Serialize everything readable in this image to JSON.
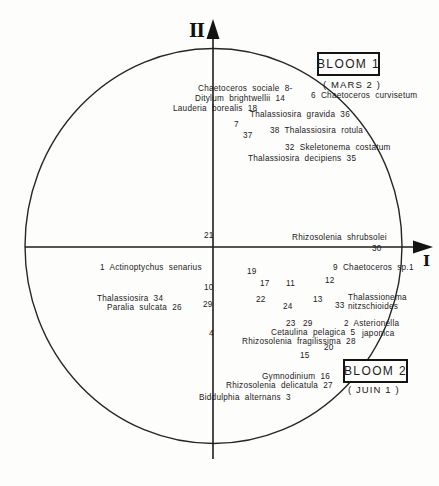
{
  "figure": {
    "axis_x_label": "I",
    "axis_y_label": "II",
    "bloom1": {
      "title": "BLOOM 1",
      "subtitle": "( MARS 2 )"
    },
    "bloom2": {
      "title": "BLOOM 2",
      "subtitle": "( JUIN 1 )"
    }
  },
  "chart_data": {
    "type": "scatter",
    "title": "",
    "axis_labels": {
      "x": "I",
      "y": "II"
    },
    "layout": "correspondence-analysis ordination: two orthogonal axes (I horizontal, II vertical) inside a unit circle; species plotted by number",
    "clusters": [
      {
        "name": "BLOOM 1",
        "season": "( MARS 2 )",
        "position": "upper right"
      },
      {
        "name": "BLOOM 2",
        "season": "( JUIN 1 )",
        "position": "lower right"
      }
    ],
    "species_by_number": {
      "1": "Actinoptychus senarius",
      "2": "Asterionella japonica",
      "3": "Biddulphia alternans",
      "5": "Cetaulina pelagica",
      "6": "Chaetoceros curvisetum",
      "8": "Chaetoceros sociale",
      "9": "Chaetoceros sp.1",
      "14": "Ditylum brightwellii",
      "16": "Gymnodinium",
      "18": "Lauderia borealis",
      "26": "Paralia sulcata",
      "27": "Rhizosolenia delicatula",
      "28": "Rhizosolenia fragilissima",
      "30": "Rhizosolenia shrubsolei",
      "32": "Skeletonema costatum",
      "33": "Thalassionema nitzschioides",
      "34": "Thalassiosira",
      "35": "Thalassiosira decipiens",
      "36": "Thalassiosira gravida",
      "38": "Thalassiosira rotula"
    },
    "numbered_points_without_species_label": [
      4,
      7,
      10,
      11,
      12,
      13,
      15,
      17,
      19,
      20,
      21,
      22,
      23,
      24,
      29,
      37
    ],
    "labels": [
      {
        "text": "Chaetoceros sociale 8-",
        "x": 198,
        "y": 84
      },
      {
        "text": "Ditylum brightwellii 14",
        "x": 195,
        "y": 94
      },
      {
        "text": "Lauderia borealis 18",
        "x": 173,
        "y": 104
      },
      {
        "text": "6 Chaetoceros curvisetum",
        "x": 311,
        "y": 91
      },
      {
        "text": "Thalassiosira gravida 36",
        "x": 250,
        "y": 110
      },
      {
        "text": "7",
        "x": 234,
        "y": 120
      },
      {
        "text": "37",
        "x": 243,
        "y": 131
      },
      {
        "text": "38 Thalassiosira rotula",
        "x": 270,
        "y": 126
      },
      {
        "text": "32 Skeletonema costatum",
        "x": 285,
        "y": 143
      },
      {
        "text": "Thalassiosira decipiens 35",
        "x": 248,
        "y": 154
      },
      {
        "text": "21",
        "x": 204,
        "y": 231
      },
      {
        "text": "Rhizosolenia shrubsolei",
        "x": 292,
        "y": 233
      },
      {
        "text": "30",
        "x": 372,
        "y": 244
      },
      {
        "text": "1 Actinoptychus senarius",
        "x": 100,
        "y": 263
      },
      {
        "text": "9 Chaetoceros sp.1",
        "x": 333,
        "y": 263
      },
      {
        "text": "19",
        "x": 247,
        "y": 267
      },
      {
        "text": "17",
        "x": 260,
        "y": 279
      },
      {
        "text": "11",
        "x": 286,
        "y": 279
      },
      {
        "text": "12",
        "x": 325,
        "y": 276
      },
      {
        "text": "10",
        "x": 204,
        "y": 283
      },
      {
        "text": "Thalassiosira 34",
        "x": 97,
        "y": 294
      },
      {
        "text": "Paralia sulcata 26",
        "x": 107,
        "y": 303
      },
      {
        "text": "29",
        "x": 203,
        "y": 300
      },
      {
        "text": "22",
        "x": 256,
        "y": 295
      },
      {
        "text": "24",
        "x": 283,
        "y": 302
      },
      {
        "text": "13",
        "x": 313,
        "y": 295
      },
      {
        "text": "Thalassionema",
        "x": 348,
        "y": 293
      },
      {
        "text": "33",
        "x": 335,
        "y": 301
      },
      {
        "text": "nitzschioides",
        "x": 348,
        "y": 302
      },
      {
        "text": "4",
        "x": 209,
        "y": 329
      },
      {
        "text": "23",
        "x": 286,
        "y": 319
      },
      {
        "text": "29",
        "x": 303,
        "y": 319
      },
      {
        "text": "2 Asterionella",
        "x": 344,
        "y": 319
      },
      {
        "text": "japonica",
        "x": 362,
        "y": 329
      },
      {
        "text": "Cetaulina pelagica 5",
        "x": 271,
        "y": 328
      },
      {
        "text": "Rhizosolenia fragilissima 28",
        "x": 242,
        "y": 337
      },
      {
        "text": "20",
        "x": 324,
        "y": 343
      },
      {
        "text": "15",
        "x": 300,
        "y": 351
      },
      {
        "text": "Gymnodinium 16",
        "x": 262,
        "y": 372
      },
      {
        "text": "Rhizosolenia delicatula 27",
        "x": 226,
        "y": 381
      },
      {
        "text": "Biddulphia alternans 3",
        "x": 199,
        "y": 393
      }
    ],
    "colors": {
      "ink": "#1c1c1c",
      "paper": "#fdfdfc"
    }
  }
}
